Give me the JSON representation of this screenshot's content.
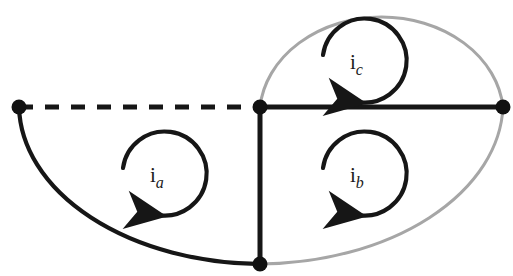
{
  "diagram": {
    "type": "circuit-mesh-diagram",
    "canvas": {
      "width": 513,
      "height": 276,
      "background": "#ffffff"
    },
    "colors": {
      "branch_dark": "#161616",
      "branch_gray": "#a6a6a6",
      "node_fill": "#111111",
      "label_text": "#1a1a1a",
      "dashed": "#161616"
    },
    "nodes": [
      {
        "name": "node-left",
        "label": "",
        "x": 19,
        "y": 107,
        "r": 7.5
      },
      {
        "name": "node-center",
        "label": "",
        "x": 260,
        "y": 107,
        "r": 7.5
      },
      {
        "name": "node-right",
        "label": "",
        "x": 503,
        "y": 107,
        "r": 7.5
      },
      {
        "name": "node-bottom",
        "label": "",
        "x": 260,
        "y": 264,
        "r": 7.5
      }
    ],
    "branches": [
      {
        "name": "branch-dashed-top-left",
        "style": "dashed",
        "color": "#161616",
        "width": 5,
        "from": "node-left",
        "to": "node-center"
      },
      {
        "name": "branch-solid-top-right",
        "style": "solid",
        "color": "#161616",
        "width": 5,
        "from": "node-center",
        "to": "node-right"
      },
      {
        "name": "branch-vertical-center",
        "style": "solid",
        "color": "#161616",
        "width": 5,
        "from": "node-center",
        "to": "node-bottom"
      },
      {
        "name": "branch-arc-left",
        "style": "arc",
        "color": "#161616",
        "width": 4,
        "from": "node-left",
        "to": "node-bottom"
      },
      {
        "name": "branch-arc-gray-top",
        "style": "arc",
        "color": "#a6a6a6",
        "width": 3,
        "from": "node-center",
        "to": "node-right"
      },
      {
        "name": "branch-arc-gray-bottom",
        "style": "arc",
        "color": "#a6a6a6",
        "width": 3,
        "from": "node-right",
        "to": "node-bottom"
      }
    ],
    "mesh_currents": [
      {
        "name": "mesh-current-a",
        "symbol": "i",
        "subscript": "a",
        "cx": 165,
        "cy": 175,
        "r": 42,
        "direction": "counterclockwise"
      },
      {
        "name": "mesh-current-b",
        "symbol": "i",
        "subscript": "b",
        "cx": 365,
        "cy": 175,
        "r": 42,
        "direction": "counterclockwise"
      },
      {
        "name": "mesh-current-c",
        "symbol": "i",
        "subscript": "c",
        "cx": 365,
        "cy": 62,
        "r": 42,
        "direction": "counterclockwise"
      }
    ]
  }
}
